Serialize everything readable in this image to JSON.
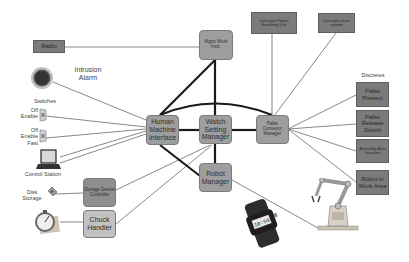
{
  "diagram": {
    "type": "system-architecture",
    "nodes": {
      "radio": "Radio",
      "mgmt": "Mgmt Work Instr.",
      "conveyor_power": "Conveyor Power Switching Unit",
      "conveyor_drive": "Conveyor drive system",
      "hmi": "Human Machine Interface",
      "watch": "Watch Setting Manager",
      "pallet_conveyor": "Pallet Conveyor Manager",
      "robot_manager": "Robot Manager",
      "storage_controller": "Storage Device Controller",
      "chuck_handler": "Chuck Handler",
      "pallet_present": "Pallet Present",
      "pallet_release": "Pallet Release Switch",
      "assembly_area": "Assembly Area Intrusion",
      "robot_work_area": "Robot in Work Area"
    },
    "labels": {
      "intrusion_alarm": "Intrusion Alarm",
      "switches": "Switches",
      "switch1": "Off Enable",
      "switch2": "Off Enable Fast",
      "control_station": "Control Station",
      "disk_storage": "Disk Storage",
      "discretes": "Discretes",
      "watch_display": "10:59"
    },
    "icons": [
      "alarm-bell-icon",
      "switch-icon",
      "computer-icon",
      "disk-icon",
      "chuck-clock-icon",
      "wristwatch-icon",
      "robot-arm-icon"
    ],
    "edges_thick": [
      [
        "mgmt",
        "hmi"
      ],
      [
        "mgmt",
        "watch"
      ],
      [
        "hmi",
        "watch"
      ],
      [
        "watch",
        "pallet_conveyor"
      ],
      [
        "hmi",
        "pallet_conveyor"
      ],
      [
        "watch",
        "robot_manager"
      ],
      [
        "hmi",
        "robot_manager"
      ]
    ],
    "edges_thin": [
      [
        "radio",
        "mgmt"
      ],
      [
        "intrusion_alarm",
        "hmi"
      ],
      [
        "switch1",
        "hmi"
      ],
      [
        "switch2",
        "hmi"
      ],
      [
        "control_station",
        "hmi"
      ],
      [
        "storage_controller",
        "watch"
      ],
      [
        "chuck_handler",
        "watch"
      ],
      [
        "disk_storage",
        "storage_controller"
      ],
      [
        "chuck_icon",
        "chuck_handler"
      ],
      [
        "conveyor_power",
        "pallet_conveyor"
      ],
      [
        "conveyor_drive",
        "pallet_conveyor"
      ],
      [
        "pallet_conveyor",
        "pallet_present"
      ],
      [
        "pallet_conveyor",
        "pallet_release"
      ],
      [
        "pallet_conveyor",
        "assembly_area"
      ],
      [
        "pallet_conveyor",
        "robot_work_area"
      ],
      [
        "robot_manager",
        "robot_arm"
      ]
    ]
  }
}
